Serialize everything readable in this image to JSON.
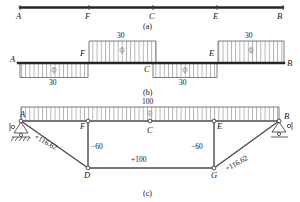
{
  "figure": {
    "panels": [
      {
        "id": "a",
        "caption": "(a)",
        "nodes": [
          {
            "label": "A",
            "x": 18,
            "y": 18
          },
          {
            "label": "F",
            "x": 88,
            "y": 18
          },
          {
            "label": "C",
            "x": 152,
            "y": 18
          },
          {
            "label": "E",
            "x": 215,
            "y": 18
          },
          {
            "label": "B",
            "x": 278,
            "y": 18
          }
        ],
        "beam": {
          "x1": 20,
          "x2": 283,
          "y": 7
        }
      },
      {
        "id": "b",
        "caption": "(b)",
        "beam": {
          "x1": 18,
          "x2": 284,
          "y": 63
        },
        "nodes": [
          {
            "label": "A",
            "x": 16,
            "y": 57
          },
          {
            "label": "F",
            "x": 78,
            "y": 50
          },
          {
            "label": "C",
            "x": 146,
            "y": 68
          },
          {
            "label": "E",
            "x": 213,
            "y": 50
          },
          {
            "label": "B",
            "x": 287,
            "y": 61
          }
        ],
        "loads": [
          {
            "value": "30",
            "x1": 20,
            "x2": 88,
            "side": "below",
            "label_x": 50,
            "label_y": 83
          },
          {
            "value": "30",
            "x1": 88,
            "x2": 156,
            "side": "above",
            "label_x": 118,
            "label_y": 34
          },
          {
            "value": "30",
            "x1": 152,
            "x2": 217,
            "side": "below",
            "label_x": 180,
            "label_y": 83
          },
          {
            "value": "30",
            "x1": 217,
            "x2": 284,
            "side": "above",
            "label_x": 246,
            "label_y": 34
          }
        ]
      },
      {
        "id": "c",
        "caption": "(c)",
        "load": {
          "value": "100",
          "x1": 20,
          "x2": 280,
          "label_x": 145,
          "label_y": 102
        },
        "nodes": [
          {
            "label": "A",
            "x": 21,
            "y": 116
          },
          {
            "label": "F",
            "x": 83,
            "y": 122
          },
          {
            "label": "C",
            "x": 150,
            "y": 130
          },
          {
            "label": "E",
            "x": 220,
            "y": 122
          },
          {
            "label": "B",
            "x": 285,
            "y": 117
          },
          {
            "label": "D",
            "x": 84,
            "y": 176
          },
          {
            "label": "G",
            "x": 214,
            "y": 176
          }
        ],
        "members": [
          {
            "name": "AD",
            "force": "+116.62",
            "label_x": 44,
            "label_y": 140
          },
          {
            "name": "FD",
            "force": "−60",
            "label_x": 88,
            "label_y": 146
          },
          {
            "name": "DG",
            "force": "+100",
            "label_x": 132,
            "label_y": 158
          },
          {
            "name": "EG",
            "force": "−60",
            "label_x": 196,
            "label_y": 146
          },
          {
            "name": "GB",
            "force": "+116.62",
            "label_x": 228,
            "label_y": 166
          }
        ],
        "supports": [
          {
            "type": "pin-support",
            "x": 22,
            "y": 125
          },
          {
            "type": "roller-support",
            "x": 279,
            "y": 125
          }
        ]
      }
    ],
    "colors": {
      "line": "#3c3c3c",
      "beam": "#262626",
      "hatch": "#8c8c8c",
      "text": "#141414",
      "support": "#4a4a4a"
    }
  }
}
